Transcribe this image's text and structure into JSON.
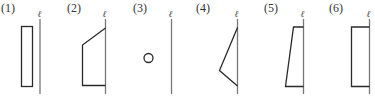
{
  "figure": {
    "axis_symbol": "ℓ",
    "colors": {
      "shape_stroke": "#2a2a2a",
      "axis_stroke": "#777777",
      "background": "#ffffff"
    },
    "panels": [
      {
        "label": "(1)",
        "shape": "rectangle",
        "description": "tall rectangle left of axis, not touching"
      },
      {
        "label": "(2)",
        "shape": "trapezoid",
        "description": "right-trapezoid with slanted top, right side on axis"
      },
      {
        "label": "(3)",
        "shape": "circle",
        "description": "small circle left of axis"
      },
      {
        "label": "(4)",
        "shape": "triangle",
        "description": "triangle with one side on axis"
      },
      {
        "label": "(5)",
        "shape": "trapezoid",
        "description": "trapezoid with slanted left side, right side on axis"
      },
      {
        "label": "(6)",
        "shape": "rectangle",
        "description": "rectangle with right side on axis"
      }
    ]
  }
}
